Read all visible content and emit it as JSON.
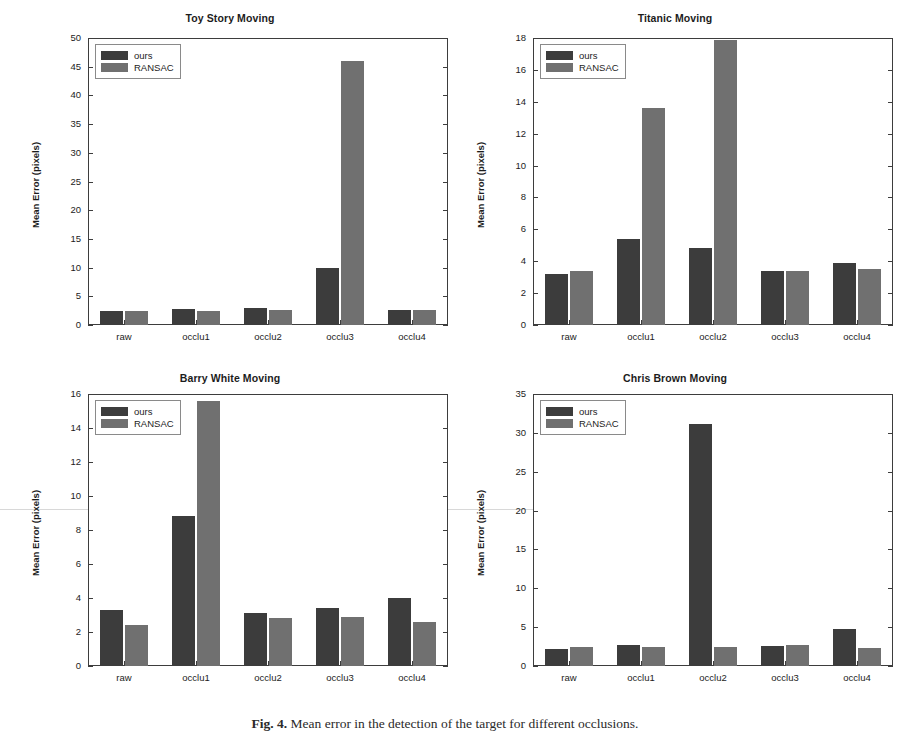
{
  "figure": {
    "caption_label": "Fig. 4.",
    "caption_text": "Mean error in the detection of the target for different occlusions.",
    "colors": {
      "ours": "#3c3c3c",
      "ransac": "#707070",
      "axis": "#3d3d3d",
      "background": "#ffffff"
    }
  },
  "legend": {
    "ours_label": "ours",
    "ransac_label": "RANSAC"
  },
  "chart_data": [
    {
      "type": "bar",
      "id": "toy-story-moving",
      "title": "Toy Story Moving",
      "xlabel": "",
      "ylabel": "Mean Error (pixels)",
      "categories": [
        "raw",
        "occlu1",
        "occlu2",
        "occlu3",
        "occlu4"
      ],
      "series": [
        {
          "name": "ours",
          "values": [
            2.5,
            2.8,
            2.9,
            9.9,
            2.7
          ]
        },
        {
          "name": "RANSAC",
          "values": [
            2.4,
            2.4,
            2.6,
            46.0,
            2.7
          ]
        }
      ],
      "ylim": [
        0,
        50
      ],
      "yticks": [
        0,
        5,
        10,
        15,
        20,
        25,
        30,
        35,
        40,
        45,
        50
      ],
      "grid": false,
      "legend_position": "upper left"
    },
    {
      "type": "bar",
      "id": "titanic-moving",
      "title": "Titanic Moving",
      "xlabel": "",
      "ylabel": "Mean Error (pixels)",
      "categories": [
        "raw",
        "occlu1",
        "occlu2",
        "occlu3",
        "occlu4"
      ],
      "series": [
        {
          "name": "ours",
          "values": [
            3.2,
            5.4,
            4.8,
            3.4,
            3.9
          ]
        },
        {
          "name": "RANSAC",
          "values": [
            3.4,
            13.6,
            17.9,
            3.4,
            3.5
          ]
        }
      ],
      "ylim": [
        0,
        18
      ],
      "yticks": [
        0,
        2,
        4,
        6,
        8,
        10,
        12,
        14,
        16,
        18
      ],
      "grid": false,
      "legend_position": "upper left"
    },
    {
      "type": "bar",
      "id": "barry-white-moving",
      "title": "Barry White Moving",
      "xlabel": "",
      "ylabel": "Mean Error (pixels)",
      "categories": [
        "raw",
        "occlu1",
        "occlu2",
        "occlu3",
        "occlu4"
      ],
      "series": [
        {
          "name": "ours",
          "values": [
            3.3,
            8.8,
            3.1,
            3.4,
            4.0
          ]
        },
        {
          "name": "RANSAC",
          "values": [
            2.4,
            15.6,
            2.8,
            2.9,
            2.6
          ]
        }
      ],
      "ylim": [
        0,
        16
      ],
      "yticks": [
        0,
        2,
        4,
        6,
        8,
        10,
        12,
        14,
        16
      ],
      "grid": false,
      "legend_position": "upper left"
    },
    {
      "type": "bar",
      "id": "chris-brown-moving",
      "title": "Chris Brown Moving",
      "xlabel": "",
      "ylabel": "Mean Error (pixels)",
      "categories": [
        "raw",
        "occlu1",
        "occlu2",
        "occlu3",
        "occlu4"
      ],
      "series": [
        {
          "name": "ours",
          "values": [
            2.2,
            2.7,
            31.2,
            2.6,
            4.8
          ]
        },
        {
          "name": "RANSAC",
          "values": [
            2.5,
            2.5,
            2.5,
            2.7,
            2.3
          ]
        }
      ],
      "ylim": [
        0,
        35
      ],
      "yticks": [
        0,
        5,
        10,
        15,
        20,
        25,
        30,
        35
      ],
      "grid": false,
      "legend_position": "upper left"
    }
  ]
}
